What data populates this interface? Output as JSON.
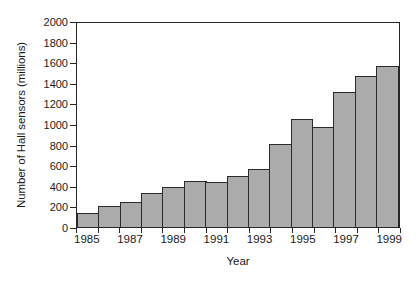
{
  "chart_data": {
    "type": "bar",
    "title": "",
    "xlabel": "Year",
    "ylabel": "Number of Hall sensors (millions)",
    "categories": [
      1985,
      1986,
      1987,
      1988,
      1989,
      1990,
      1991,
      1992,
      1993,
      1994,
      1995,
      1996,
      1997,
      1998,
      1999
    ],
    "values": [
      135,
      205,
      245,
      330,
      390,
      450,
      440,
      495,
      565,
      805,
      1050,
      970,
      1310,
      1465,
      1560
    ],
    "series": [
      {
        "name": "Hall sensors shipped",
        "values": [
          135,
          205,
          245,
          330,
          390,
          450,
          440,
          495,
          565,
          805,
          1050,
          970,
          1310,
          1465,
          1560
        ]
      }
    ],
    "ylim": [
      0,
      2000
    ],
    "ytick_values": [
      0,
      200,
      400,
      600,
      800,
      1000,
      1200,
      1400,
      1600,
      1800,
      2000
    ],
    "ytick_labels": [
      "0",
      "200",
      "400",
      "600",
      "800",
      "1000",
      "1200",
      "1400",
      "1600",
      "1800",
      "2000"
    ],
    "xtick_values": [
      1985,
      1987,
      1989,
      1991,
      1993,
      1995,
      1997,
      1999
    ],
    "xtick_labels": [
      "1985",
      "1987",
      "1989",
      "1991",
      "1993",
      "1995",
      "1997",
      "1999"
    ],
    "grid": false,
    "legend": false,
    "legend_position": "none",
    "bar_fill_color": "#ababab",
    "bar_edge_color": "#2b2b2b",
    "axis_color": "#262626",
    "background_color": "#ffffff"
  }
}
